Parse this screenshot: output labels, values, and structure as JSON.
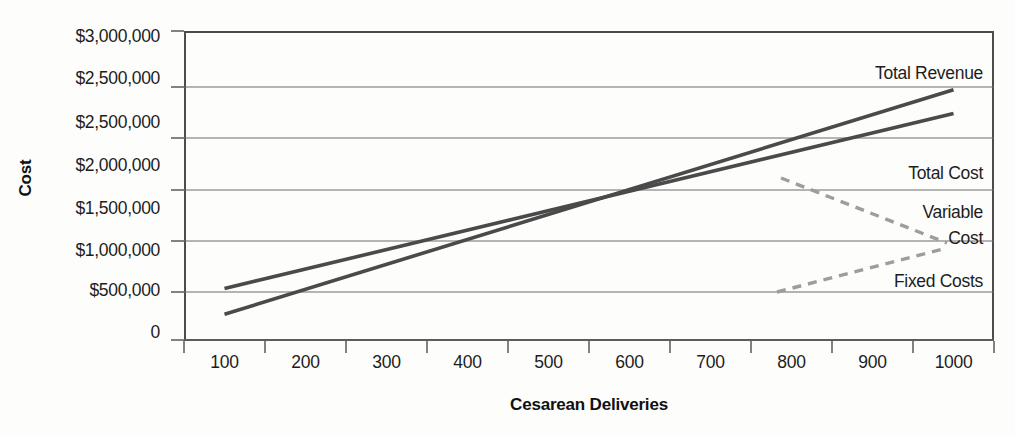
{
  "chart_data": {
    "type": "line",
    "title": "",
    "xlabel": "Cesarean Deliveries",
    "ylabel": "Cost",
    "grid": true,
    "legend_position": "inline-right-annotations",
    "x": [
      100,
      200,
      300,
      400,
      500,
      600,
      700,
      800,
      900,
      1000
    ],
    "xlim": [
      50,
      1050
    ],
    "ylim": [
      0,
      3000000
    ],
    "y_tick_labels": [
      "$3,000,000",
      "$2,500,000",
      "$2,500,000",
      "$2,000,000",
      "$1,500,000",
      "$1,000,000",
      "$500,000",
      "0"
    ],
    "x_tick_labels": [
      "100",
      "200",
      "300",
      "400",
      "500",
      "600",
      "700",
      "800",
      "900",
      "1000"
    ],
    "series": [
      {
        "name": "Total Revenue",
        "style": "solid",
        "color": "#4a4a4a",
        "endpoints": [
          {
            "x": 100,
            "y": 250000
          },
          {
            "x": 1000,
            "y": 2430000
          }
        ],
        "values": [
          250000,
          492000,
          734000,
          976000,
          1218000,
          1460000,
          1702000,
          1944000,
          2186000,
          2430000
        ]
      },
      {
        "name": "Total Cost",
        "style": "solid",
        "color": "#4a4a4a",
        "endpoints": [
          {
            "x": 100,
            "y": 500000
          },
          {
            "x": 1000,
            "y": 2200000
          }
        ],
        "values": [
          500000,
          689000,
          878000,
          1067000,
          1256000,
          1444000,
          1633000,
          1822000,
          2011000,
          2200000
        ]
      },
      {
        "name": "Fixed Costs",
        "style": "solid",
        "color": "#4a4a4a",
        "endpoints": [
          {
            "x": 50,
            "y": 500000
          },
          {
            "x": 1050,
            "y": 500000
          }
        ],
        "values": [
          500000,
          500000,
          500000,
          500000,
          500000,
          500000,
          500000,
          500000,
          500000,
          500000
        ]
      },
      {
        "name": "Variable Cost",
        "style": "dashed-bracket",
        "color": "#9d9d9d",
        "note": "dashed leader bracket spanning the gap between Total Cost and Fixed Costs"
      }
    ],
    "annotations": [
      {
        "text": "Total Revenue",
        "x_px": 983,
        "y_px": 73
      },
      {
        "text": "Total Cost",
        "x_px": 983,
        "y_px": 173
      },
      {
        "text": "Variable",
        "x_px": 983,
        "y_px": 212
      },
      {
        "text": "Cost",
        "x_px": 983,
        "y_px": 238
      },
      {
        "text": "Fixed Costs",
        "x_px": 983,
        "y_px": 281
      }
    ]
  },
  "axes": {
    "y_title": "Cost",
    "x_title": "Cesarean Deliveries"
  }
}
